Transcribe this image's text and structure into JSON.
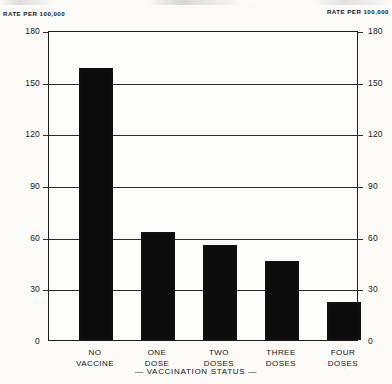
{
  "axis_unit_caption_left": "RATE PER 100,000",
  "axis_unit_caption_right": "RATE PER 100,000",
  "xaxis_title": "— VACCINATION STATUS —",
  "chart_data": {
    "type": "bar",
    "title": "",
    "subtitle": "",
    "xlabel": "— VACCINATION STATUS —",
    "ylabel": "RATE PER 100,000",
    "ylabel_right": "RATE PER 100,000",
    "categories": [
      "NO\nVACCINE",
      "ONE\nDOSE",
      "TWO\nDOSES",
      "THREE\nDOSES",
      "FOUR\nDOSES"
    ],
    "category_labels_flat": [
      "NO VACCINE",
      "ONE DOSE",
      "TWO DOSES",
      "THREE DOSES",
      "FOUR DOSES"
    ],
    "values": [
      158,
      63,
      55,
      46,
      22
    ],
    "ylim": [
      0,
      180
    ],
    "yticks": [
      0,
      30,
      60,
      90,
      120,
      150,
      180
    ],
    "ytick_labels": [
      "0",
      "30",
      "60",
      "90",
      "120",
      "150",
      "180"
    ],
    "yticks_right": [
      0,
      30,
      60,
      90,
      120,
      150,
      180
    ],
    "ytick_labels_right": [
      "0",
      "30",
      "60",
      "90",
      "120",
      "150",
      "180"
    ],
    "grid": true,
    "grid_axis": "y",
    "legend": false,
    "legend_position": "none",
    "bar_color": "#0c0c0c",
    "background_color": "#fdfdfb",
    "axis_color": "#1d1d1d"
  }
}
